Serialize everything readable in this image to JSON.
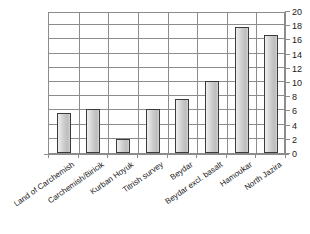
{
  "chart_data": {
    "type": "bar",
    "title": "",
    "xlabel": "",
    "ylabel": "",
    "ylim": [
      0,
      20
    ],
    "ytick_step": 2,
    "yticks": [
      0,
      2,
      4,
      6,
      8,
      10,
      12,
      14,
      16,
      18,
      20
    ],
    "grid": true,
    "legend": false,
    "categories": [
      "Land of Carchemish",
      "Carchemish/Biricik",
      "Kurban Hoyuk",
      "Titrish survey",
      "Beydar",
      "Beydar excl. basalt",
      "Hamoukar",
      "North Jazira"
    ],
    "values": [
      5.7,
      6.2,
      2.0,
      6.2,
      7.6,
      10.1,
      17.8,
      16.6
    ],
    "series": [
      {
        "name": "",
        "values": [
          5.7,
          6.2,
          2.0,
          6.2,
          7.6,
          10.1,
          17.8,
          16.6
        ]
      }
    ],
    "axis_position": {
      "y_axis": "right",
      "x_axis": "bottom"
    },
    "bar_style": {
      "fill": "#cccccc",
      "border": "#3a3a3a"
    }
  }
}
